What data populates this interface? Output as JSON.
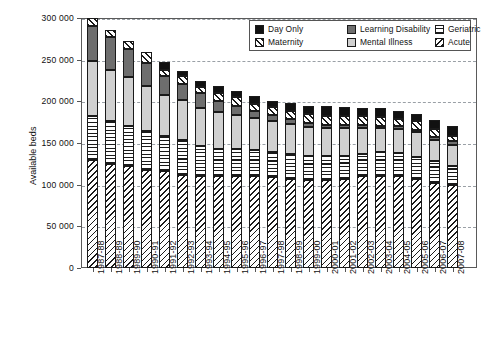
{
  "chart_data": {
    "type": "bar",
    "stacked": true,
    "title": "",
    "xlabel": "",
    "ylabel": "Available beds",
    "ylim": [
      0,
      300000
    ],
    "ytick_values": [
      0,
      50000,
      100000,
      150000,
      200000,
      250000,
      300000
    ],
    "ytick_labels": [
      "0",
      "50 000",
      "100 000",
      "150 000",
      "200 000",
      "250 000",
      "300 000"
    ],
    "grid": "horizontal-dashed",
    "legend_position": "top-right-inside",
    "categories": [
      "1987-88",
      "1988-89",
      "1989-90",
      "1990-91",
      "1991-92",
      "1992-93",
      "1993-94",
      "1994-95",
      "1995-96",
      "1996-97",
      "1997-98",
      "1998-99",
      "1999-00",
      "2000-01",
      "2001-02",
      "2002-03",
      "2003-04",
      "2004-05",
      "2005-06",
      "2006-07",
      "2007-08"
    ],
    "series": [
      {
        "name": "Acute",
        "pattern": "diagonal-hatch-back",
        "values": [
          130000,
          125000,
          122000,
          118000,
          116000,
          112000,
          111000,
          110000,
          110000,
          110000,
          109000,
          107000,
          106000,
          106000,
          107000,
          110000,
          110000,
          110000,
          107000,
          102000,
          100000
        ]
      },
      {
        "name": "Geriatric",
        "pattern": "horizontal-lines",
        "values": [
          52000,
          51000,
          49000,
          46000,
          42000,
          42000,
          36000,
          33000,
          33000,
          32000,
          30000,
          30000,
          29000,
          29000,
          28000,
          27000,
          29000,
          28000,
          26000,
          26000,
          22000
        ]
      },
      {
        "name": "Mental Illness",
        "color": "#d0d0d0",
        "values": [
          66000,
          62000,
          58000,
          54000,
          50000,
          48000,
          45000,
          44000,
          41000,
          38000,
          37000,
          36000,
          34000,
          33000,
          33000,
          31000,
          29000,
          29000,
          30000,
          26000,
          26000
        ]
      },
      {
        "name": "Learning Disability",
        "color": "#6e6e6e",
        "values": [
          42000,
          39000,
          34000,
          28000,
          22000,
          19000,
          18000,
          13000,
          11000,
          9000,
          8000,
          6000,
          5000,
          4000,
          4000,
          4000,
          3000,
          3000,
          3000,
          3000,
          5000
        ]
      },
      {
        "name": "Maternity",
        "pattern": "diagonal-hatch-fwd",
        "values": [
          10000,
          9000,
          10000,
          13000,
          8000,
          9000,
          7000,
          10000,
          10000,
          8000,
          9000,
          10000,
          11000,
          11000,
          11000,
          10000,
          10000,
          9000,
          10000,
          10000,
          6000
        ]
      },
      {
        "name": "Day Only",
        "color": "#111111",
        "values": [
          0,
          0,
          0,
          0,
          9000,
          7000,
          7000,
          8000,
          8000,
          9000,
          8000,
          9000,
          10000,
          11000,
          10000,
          10000,
          11000,
          10000,
          9000,
          11000,
          11000
        ]
      }
    ],
    "totals": [
      300000,
      286000,
      273000,
      259000,
      247000,
      237000,
      224000,
      218000,
      213000,
      206000,
      201000,
      198000,
      195000,
      194000,
      193000,
      192000,
      192000,
      189000,
      185000,
      178000,
      170000
    ]
  },
  "legend": {
    "entries": [
      {
        "label": "Day Only",
        "swatch": "solid-black-swatch"
      },
      {
        "label": "Learning Disability",
        "swatch": "solid-gray-swatch"
      },
      {
        "label": "Geriatric",
        "swatch": "horizontal-lines-swatch"
      },
      {
        "label": "Maternity",
        "swatch": "diagonal-hatch-fwd-swatch"
      },
      {
        "label": "Mental Illness",
        "swatch": "solid-lightgray-swatch"
      },
      {
        "label": "Acute",
        "swatch": "diagonal-hatch-back-swatch"
      }
    ]
  }
}
